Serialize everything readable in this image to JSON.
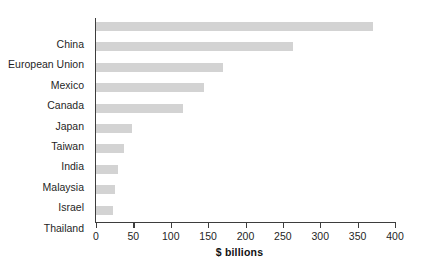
{
  "chart_data": {
    "type": "bar",
    "orientation": "horizontal",
    "title": "",
    "xlabel": "$ billions",
    "ylabel": "",
    "categories": [
      "China",
      "European Union",
      "Mexico",
      "Canada",
      "Japan",
      "Taiwan",
      "India",
      "Malaysia",
      "Israel",
      "Thailand"
    ],
    "values": [
      370,
      263,
      170,
      145,
      116,
      48,
      37,
      29,
      26,
      23
    ],
    "xlim": [
      0,
      400
    ],
    "xticks": [
      0,
      50,
      100,
      150,
      200,
      250,
      300,
      350,
      400
    ],
    "xtick_labels": [
      "0",
      "50",
      "100",
      "150",
      "200",
      "250",
      "300",
      "350",
      "400"
    ],
    "grid": false,
    "legend": null,
    "bar_color": "#d3d3d3",
    "axis_color": "#3d3d3d",
    "text_color": "#1f1f1f"
  }
}
